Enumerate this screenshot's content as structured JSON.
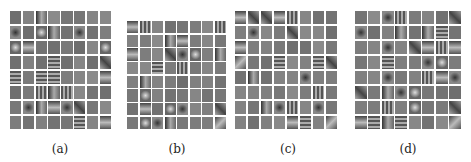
{
  "figure": {
    "panels": [
      {
        "id": "a",
        "caption": "(a)",
        "rows": 8,
        "cols": 8,
        "x": 10,
        "y": 11,
        "w": 101,
        "h": 118,
        "cap_x": 40,
        "cap_y": 142
      },
      {
        "id": "b",
        "caption": "(b)",
        "rows": 8,
        "cols": 8,
        "x": 127,
        "y": 21,
        "w": 99,
        "h": 108,
        "cap_x": 157,
        "cap_y": 142
      },
      {
        "id": "c",
        "caption": "(c)",
        "rows": 8,
        "cols": 8,
        "x": 235,
        "y": 11,
        "w": 102,
        "h": 118,
        "cap_x": 268,
        "cap_y": 142
      },
      {
        "id": "d",
        "caption": "(d)",
        "rows": 8,
        "cols": 8,
        "x": 355,
        "y": 11,
        "w": 106,
        "h": 118,
        "cap_x": 388,
        "cap_y": 142
      }
    ],
    "cell_color": "#7c7c7c"
  }
}
